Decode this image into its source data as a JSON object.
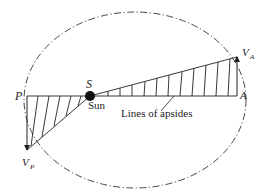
{
  "diagram": {
    "colors": {
      "stroke": "#222222",
      "background": "#ffffff"
    },
    "labels": {
      "perihelion": "P",
      "aphelion": "A",
      "focus": "S",
      "sun": "Sun",
      "apsides": "Lines of apsides",
      "velocity_aphelion_main": "V",
      "velocity_aphelion_sub": "A",
      "velocity_perihelion_main": "V",
      "velocity_perihelion_sub": "P"
    },
    "elements": [
      {
        "id": "orbit-ellipse",
        "type": "ellipse",
        "style": "dash-dot"
      },
      {
        "id": "line-of-apsides",
        "type": "line",
        "from": "P",
        "to": "A"
      },
      {
        "id": "sun",
        "type": "filled-circle",
        "at": "S"
      },
      {
        "id": "velocity-perihelion",
        "type": "arrow",
        "at": "P",
        "direction": "down"
      },
      {
        "id": "velocity-aphelion",
        "type": "arrow",
        "at": "A",
        "direction": "up"
      },
      {
        "id": "swept-area-perihelion",
        "type": "hatched-triangle",
        "vertices": [
          "P",
          "S",
          "V_P"
        ]
      },
      {
        "id": "swept-area-aphelion",
        "type": "hatched-triangle",
        "vertices": [
          "S",
          "A",
          "V_A"
        ]
      }
    ]
  }
}
